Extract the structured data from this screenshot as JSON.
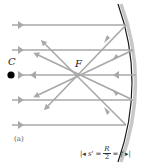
{
  "figure": {
    "panel_label": "(a)",
    "points": {
      "center": "C",
      "focal": "F"
    },
    "formula": {
      "left_bracket": "|◂",
      "lhs": "s'",
      "eq1": "=",
      "numerator": "R",
      "denominator": "2",
      "eq2": "=",
      "rhs": "f",
      "right_bracket": "▸|"
    },
    "colors": {
      "ray": "#a8a8a8",
      "mirror_surface": "#1a1a1a",
      "mirror_back": "#c8c8c8",
      "center_dot": "#000000"
    },
    "rays": {
      "incident_y": [
        25,
        50,
        75,
        100,
        125
      ],
      "focal_point": [
        77,
        75
      ]
    }
  }
}
